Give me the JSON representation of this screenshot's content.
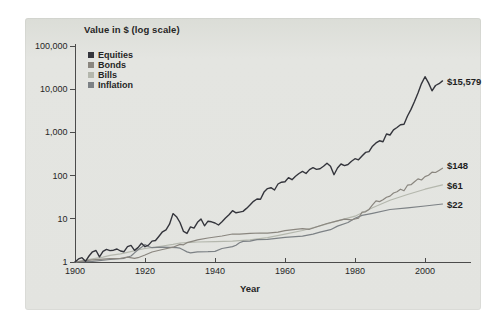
{
  "figure": {
    "title": "Value in $ (log scale)",
    "xlabel": "Year",
    "panel_background": "#e3e4e0",
    "axis_color": "#4b4b4b",
    "text_color": "#262626"
  },
  "chart_data": {
    "type": "line",
    "title": "Value in $ (log scale)",
    "xlabel": "Year",
    "ylabel": "Value in $ (log scale)",
    "log_y": true,
    "xlim": [
      1900,
      2013
    ],
    "ylim": [
      1,
      100000
    ],
    "grid": false,
    "legend_position": "top-left-inside",
    "x_ticks": [
      1900,
      1920,
      1940,
      1960,
      1980,
      2000
    ],
    "y_ticks": [
      {
        "label": "100,000",
        "value": 100000
      },
      {
        "label": "10,000",
        "value": 10000
      },
      {
        "label": "1,000",
        "value": 1000
      },
      {
        "label": "100",
        "value": 100
      },
      {
        "label": "10",
        "value": 10
      },
      {
        "label": "1",
        "value": 1
      }
    ],
    "series": [
      {
        "name": "Equities",
        "color": "#34353c",
        "width": 1.4,
        "end_label": "$15,579",
        "final_value": 15579,
        "points": [
          [
            1900,
            1.0
          ],
          [
            1901,
            1.18
          ],
          [
            1902,
            1.26
          ],
          [
            1903,
            1.04
          ],
          [
            1904,
            1.38
          ],
          [
            1905,
            1.72
          ],
          [
            1906,
            1.85
          ],
          [
            1907,
            1.32
          ],
          [
            1908,
            1.76
          ],
          [
            1909,
            1.96
          ],
          [
            1910,
            1.84
          ],
          [
            1911,
            1.88
          ],
          [
            1912,
            2.0
          ],
          [
            1913,
            1.8
          ],
          [
            1914,
            1.73
          ],
          [
            1915,
            2.26
          ],
          [
            1916,
            2.42
          ],
          [
            1917,
            1.86
          ],
          [
            1918,
            2.16
          ],
          [
            1919,
            2.72
          ],
          [
            1920,
            2.26
          ],
          [
            1921,
            2.46
          ],
          [
            1922,
            3.05
          ],
          [
            1923,
            3.15
          ],
          [
            1924,
            3.95
          ],
          [
            1925,
            5.0
          ],
          [
            1926,
            5.55
          ],
          [
            1927,
            7.5
          ],
          [
            1928,
            13.2
          ],
          [
            1929,
            11.2
          ],
          [
            1930,
            8.2
          ],
          [
            1931,
            5.1
          ],
          [
            1932,
            4.6
          ],
          [
            1933,
            6.5
          ],
          [
            1934,
            6.1
          ],
          [
            1935,
            8.3
          ],
          [
            1936,
            9.9
          ],
          [
            1937,
            6.9
          ],
          [
            1938,
            8.8
          ],
          [
            1939,
            8.5
          ],
          [
            1940,
            8.0
          ],
          [
            1941,
            7.2
          ],
          [
            1942,
            8.5
          ],
          [
            1943,
            10.4
          ],
          [
            1944,
            12.4
          ],
          [
            1945,
            15.4
          ],
          [
            1946,
            13.8
          ],
          [
            1947,
            14.3
          ],
          [
            1948,
            14.8
          ],
          [
            1949,
            17.4
          ],
          [
            1950,
            21.0
          ],
          [
            1951,
            25.4
          ],
          [
            1952,
            28.8
          ],
          [
            1953,
            28.2
          ],
          [
            1954,
            41.5
          ],
          [
            1955,
            50.0
          ],
          [
            1956,
            52.5
          ],
          [
            1957,
            46.5
          ],
          [
            1958,
            64.0
          ],
          [
            1959,
            70.5
          ],
          [
            1960,
            72.0
          ],
          [
            1961,
            90.0
          ],
          [
            1962,
            80.5
          ],
          [
            1963,
            96.5
          ],
          [
            1964,
            112
          ],
          [
            1965,
            125
          ],
          [
            1966,
            112
          ],
          [
            1967,
            138
          ],
          [
            1968,
            152
          ],
          [
            1969,
            139
          ],
          [
            1970,
            144
          ],
          [
            1971,
            164
          ],
          [
            1972,
            194
          ],
          [
            1973,
            165
          ],
          [
            1974,
            105
          ],
          [
            1975,
            150
          ],
          [
            1976,
            186
          ],
          [
            1977,
            170
          ],
          [
            1978,
            181
          ],
          [
            1979,
            216
          ],
          [
            1980,
            246
          ],
          [
            1981,
            232
          ],
          [
            1982,
            282
          ],
          [
            1983,
            345
          ],
          [
            1984,
            360
          ],
          [
            1985,
            480
          ],
          [
            1986,
            570
          ],
          [
            1987,
            640
          ],
          [
            1988,
            610
          ],
          [
            1989,
            920
          ],
          [
            1990,
            870
          ],
          [
            1991,
            1150
          ],
          [
            1992,
            1300
          ],
          [
            1993,
            1500
          ],
          [
            1994,
            1550
          ],
          [
            1995,
            2400
          ],
          [
            1996,
            3400
          ],
          [
            1997,
            5200
          ],
          [
            1998,
            8200
          ],
          [
            1999,
            13500
          ],
          [
            2000,
            19500
          ],
          [
            2001,
            14000
          ],
          [
            2002,
            9200
          ],
          [
            2003,
            12200
          ],
          [
            2004,
            13400
          ],
          [
            2005,
            15579
          ]
        ]
      },
      {
        "name": "Bonds",
        "color": "#8a867f",
        "width": 1.2,
        "end_label": "$148",
        "final_value": 148,
        "points": [
          [
            1900,
            1.0
          ],
          [
            1902,
            1.05
          ],
          [
            1905,
            1.12
          ],
          [
            1908,
            1.16
          ],
          [
            1910,
            1.2
          ],
          [
            1913,
            1.22
          ],
          [
            1915,
            1.3
          ],
          [
            1917,
            1.22
          ],
          [
            1918,
            1.26
          ],
          [
            1920,
            1.45
          ],
          [
            1922,
            1.7
          ],
          [
            1925,
            1.95
          ],
          [
            1928,
            2.2
          ],
          [
            1930,
            2.55
          ],
          [
            1931,
            2.5
          ],
          [
            1932,
            2.8
          ],
          [
            1934,
            3.1
          ],
          [
            1935,
            3.25
          ],
          [
            1938,
            3.6
          ],
          [
            1940,
            3.8
          ],
          [
            1942,
            4.0
          ],
          [
            1945,
            4.45
          ],
          [
            1947,
            4.4
          ],
          [
            1950,
            4.6
          ],
          [
            1953,
            4.7
          ],
          [
            1955,
            4.65
          ],
          [
            1958,
            4.9
          ],
          [
            1960,
            5.3
          ],
          [
            1963,
            5.7
          ],
          [
            1965,
            5.9
          ],
          [
            1967,
            5.7
          ],
          [
            1970,
            6.9
          ],
          [
            1972,
            7.8
          ],
          [
            1975,
            9.0
          ],
          [
            1977,
            9.8
          ],
          [
            1979,
            9.5
          ],
          [
            1980,
            9.9
          ],
          [
            1981,
            10.3
          ],
          [
            1982,
            14.2
          ],
          [
            1983,
            14.5
          ],
          [
            1984,
            16.5
          ],
          [
            1985,
            21.0
          ],
          [
            1986,
            26.0
          ],
          [
            1987,
            25.0
          ],
          [
            1988,
            27.5
          ],
          [
            1989,
            31.5
          ],
          [
            1990,
            33.5
          ],
          [
            1991,
            39.5
          ],
          [
            1992,
            42.5
          ],
          [
            1993,
            48.5
          ],
          [
            1994,
            44.5
          ],
          [
            1995,
            60.0
          ],
          [
            1996,
            61.5
          ],
          [
            1997,
            72.0
          ],
          [
            1998,
            84.0
          ],
          [
            1999,
            79.0
          ],
          [
            2000,
            95.0
          ],
          [
            2001,
            102
          ],
          [
            2002,
            120
          ],
          [
            2003,
            118
          ],
          [
            2004,
            132
          ],
          [
            2005,
            148
          ]
        ]
      },
      {
        "name": "Bills",
        "color": "#b4b7ad",
        "width": 1.2,
        "end_label": "$61",
        "final_value": 61,
        "points": [
          [
            1900,
            1.0
          ],
          [
            1903,
            1.1
          ],
          [
            1905,
            1.18
          ],
          [
            1908,
            1.3
          ],
          [
            1910,
            1.42
          ],
          [
            1913,
            1.55
          ],
          [
            1915,
            1.68
          ],
          [
            1918,
            1.9
          ],
          [
            1920,
            2.05
          ],
          [
            1923,
            2.2
          ],
          [
            1925,
            2.35
          ],
          [
            1928,
            2.55
          ],
          [
            1930,
            2.75
          ],
          [
            1933,
            2.85
          ],
          [
            1935,
            2.9
          ],
          [
            1940,
            2.95
          ],
          [
            1945,
            3.05
          ],
          [
            1950,
            3.25
          ],
          [
            1955,
            3.65
          ],
          [
            1960,
            4.4
          ],
          [
            1965,
            5.35
          ],
          [
            1970,
            6.9
          ],
          [
            1975,
            9.0
          ],
          [
            1980,
            11.5
          ],
          [
            1985,
            18.0
          ],
          [
            1990,
            27.0
          ],
          [
            1995,
            36.5
          ],
          [
            2000,
            48.5
          ],
          [
            2005,
            61
          ]
        ]
      },
      {
        "name": "Inflation",
        "color": "#7c8185",
        "width": 1.2,
        "end_label": "$22",
        "final_value": 22,
        "points": [
          [
            1900,
            1.0
          ],
          [
            1905,
            1.04
          ],
          [
            1910,
            1.14
          ],
          [
            1914,
            1.22
          ],
          [
            1916,
            1.38
          ],
          [
            1917,
            1.62
          ],
          [
            1918,
            1.92
          ],
          [
            1919,
            2.2
          ],
          [
            1920,
            2.55
          ],
          [
            1921,
            2.28
          ],
          [
            1922,
            2.14
          ],
          [
            1925,
            2.2
          ],
          [
            1929,
            2.15
          ],
          [
            1930,
            2.09
          ],
          [
            1931,
            1.9
          ],
          [
            1932,
            1.71
          ],
          [
            1933,
            1.62
          ],
          [
            1935,
            1.72
          ],
          [
            1938,
            1.73
          ],
          [
            1940,
            1.76
          ],
          [
            1942,
            2.05
          ],
          [
            1945,
            2.27
          ],
          [
            1946,
            2.45
          ],
          [
            1947,
            2.8
          ],
          [
            1948,
            3.0
          ],
          [
            1950,
            3.03
          ],
          [
            1952,
            3.3
          ],
          [
            1955,
            3.36
          ],
          [
            1960,
            3.72
          ],
          [
            1965,
            3.96
          ],
          [
            1968,
            4.4
          ],
          [
            1970,
            4.89
          ],
          [
            1973,
            5.6
          ],
          [
            1975,
            6.78
          ],
          [
            1978,
            8.2
          ],
          [
            1980,
            10.3
          ],
          [
            1982,
            12.0
          ],
          [
            1985,
            13.4
          ],
          [
            1990,
            16.4
          ],
          [
            1995,
            18.0
          ],
          [
            2000,
            19.8
          ],
          [
            2005,
            22
          ]
        ]
      }
    ]
  }
}
